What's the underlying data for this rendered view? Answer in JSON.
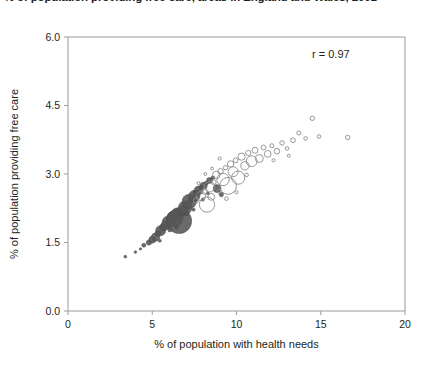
{
  "title": "% of population providing free care, areas in England and Wales, 2001",
  "annotation": "r = 0.97",
  "axis": {
    "x_title": "% of population with health needs",
    "y_title": "% of population providing free care",
    "x_ticks": [
      "0",
      "5",
      "10",
      "15",
      "20"
    ],
    "y_ticks": [
      "0.0",
      "1.5",
      "3.0",
      "4.5",
      "6.0"
    ]
  },
  "colors": {
    "filled": "#575757",
    "open_stroke": "#8c8c8c",
    "frame": "#9a9a9a",
    "text": "#231f20"
  },
  "chart_data": {
    "type": "scatter",
    "title": "% of population providing free care, areas in England and Wales, 2001",
    "xlabel": "% of population with health needs",
    "ylabel": "% of population providing free care",
    "xlim": [
      0,
      20
    ],
    "ylim": [
      0.0,
      6.0
    ],
    "xticks": [
      0,
      5,
      10,
      15,
      20
    ],
    "yticks": [
      0.0,
      1.5,
      3.0,
      4.5,
      6.0
    ],
    "grid": false,
    "legend": "none",
    "annotations": [
      {
        "text": "r = 0.97",
        "x": 15.6,
        "y": 5.55
      }
    ],
    "note": "Bubble scatter; marker size encodes area population. Dark filled markers at low x, open markers at high x.",
    "series": [
      {
        "name": "filled",
        "style": "filled",
        "points": [
          {
            "x": 3.4,
            "y": 1.19,
            "r": 1.4
          },
          {
            "x": 4.0,
            "y": 1.29,
            "r": 1.3
          },
          {
            "x": 4.5,
            "y": 1.44,
            "r": 2.0
          },
          {
            "x": 4.8,
            "y": 1.5,
            "r": 2.6
          },
          {
            "x": 5.0,
            "y": 1.56,
            "r": 3.4
          },
          {
            "x": 5.2,
            "y": 1.62,
            "r": 4.2
          },
          {
            "x": 5.35,
            "y": 1.7,
            "r": 3.0
          },
          {
            "x": 5.5,
            "y": 1.76,
            "r": 5.0
          },
          {
            "x": 5.65,
            "y": 1.83,
            "r": 3.6
          },
          {
            "x": 5.8,
            "y": 1.88,
            "r": 4.6
          },
          {
            "x": 5.95,
            "y": 1.95,
            "r": 6.0
          },
          {
            "x": 6.1,
            "y": 2.0,
            "r": 4.0
          },
          {
            "x": 6.2,
            "y": 2.06,
            "r": 5.4
          },
          {
            "x": 6.35,
            "y": 2.02,
            "r": 8.0
          },
          {
            "x": 6.5,
            "y": 2.12,
            "r": 6.4
          },
          {
            "x": 6.6,
            "y": 1.97,
            "r": 12.5
          },
          {
            "x": 6.8,
            "y": 2.2,
            "r": 5.0
          },
          {
            "x": 6.95,
            "y": 2.26,
            "r": 6.8
          },
          {
            "x": 7.1,
            "y": 2.33,
            "r": 4.2
          },
          {
            "x": 7.2,
            "y": 2.4,
            "r": 7.2
          },
          {
            "x": 7.35,
            "y": 2.46,
            "r": 3.4
          },
          {
            "x": 7.5,
            "y": 2.52,
            "r": 5.6
          },
          {
            "x": 7.6,
            "y": 2.59,
            "r": 3.0
          },
          {
            "x": 7.75,
            "y": 2.64,
            "r": 4.4
          },
          {
            "x": 7.9,
            "y": 2.7,
            "r": 2.4
          },
          {
            "x": 8.05,
            "y": 2.74,
            "r": 3.6
          },
          {
            "x": 8.2,
            "y": 2.8,
            "r": 2.0
          },
          {
            "x": 8.4,
            "y": 2.86,
            "r": 3.0
          },
          {
            "x": 8.6,
            "y": 2.92,
            "r": 1.8
          },
          {
            "x": 8.85,
            "y": 2.68,
            "r": 4.0
          },
          {
            "x": 9.1,
            "y": 2.55,
            "r": 2.2
          },
          {
            "x": 6.05,
            "y": 1.78,
            "r": 2.2
          },
          {
            "x": 6.45,
            "y": 1.83,
            "r": 1.8
          },
          {
            "x": 7.05,
            "y": 2.13,
            "r": 2.0
          },
          {
            "x": 7.45,
            "y": 2.22,
            "r": 1.6
          },
          {
            "x": 8.0,
            "y": 2.44,
            "r": 1.6
          },
          {
            "x": 8.3,
            "y": 2.58,
            "r": 1.5
          },
          {
            "x": 5.45,
            "y": 1.54,
            "r": 1.5
          },
          {
            "x": 4.3,
            "y": 1.36,
            "r": 1.2
          }
        ]
      },
      {
        "name": "open",
        "style": "open",
        "points": [
          {
            "x": 7.6,
            "y": 2.42,
            "r": 2.6
          },
          {
            "x": 7.9,
            "y": 2.52,
            "r": 4.6
          },
          {
            "x": 8.1,
            "y": 2.62,
            "r": 3.0
          },
          {
            "x": 8.25,
            "y": 2.33,
            "r": 7.6
          },
          {
            "x": 8.4,
            "y": 2.72,
            "r": 5.2
          },
          {
            "x": 8.5,
            "y": 2.5,
            "r": 3.4
          },
          {
            "x": 8.65,
            "y": 2.82,
            "r": 2.4
          },
          {
            "x": 8.8,
            "y": 2.98,
            "r": 3.8
          },
          {
            "x": 8.95,
            "y": 2.62,
            "r": 2.0
          },
          {
            "x": 9.05,
            "y": 3.06,
            "r": 2.8
          },
          {
            "x": 9.2,
            "y": 2.88,
            "r": 6.2
          },
          {
            "x": 9.35,
            "y": 3.14,
            "r": 2.2
          },
          {
            "x": 9.5,
            "y": 2.74,
            "r": 8.4
          },
          {
            "x": 9.65,
            "y": 3.22,
            "r": 3.2
          },
          {
            "x": 9.8,
            "y": 3.05,
            "r": 5.0
          },
          {
            "x": 9.95,
            "y": 3.3,
            "r": 2.4
          },
          {
            "x": 10.1,
            "y": 2.92,
            "r": 6.6
          },
          {
            "x": 10.3,
            "y": 3.38,
            "r": 3.6
          },
          {
            "x": 10.5,
            "y": 3.18,
            "r": 4.2
          },
          {
            "x": 10.7,
            "y": 3.46,
            "r": 2.6
          },
          {
            "x": 10.9,
            "y": 3.28,
            "r": 5.4
          },
          {
            "x": 11.1,
            "y": 3.52,
            "r": 3.0
          },
          {
            "x": 11.35,
            "y": 3.34,
            "r": 4.0
          },
          {
            "x": 11.6,
            "y": 3.58,
            "r": 2.4
          },
          {
            "x": 11.85,
            "y": 3.44,
            "r": 3.4
          },
          {
            "x": 12.1,
            "y": 3.62,
            "r": 2.0
          },
          {
            "x": 12.4,
            "y": 3.5,
            "r": 2.8
          },
          {
            "x": 12.7,
            "y": 3.68,
            "r": 2.2
          },
          {
            "x": 13.0,
            "y": 3.56,
            "r": 1.8
          },
          {
            "x": 13.35,
            "y": 3.74,
            "r": 2.4
          },
          {
            "x": 13.7,
            "y": 3.9,
            "r": 2.0
          },
          {
            "x": 14.1,
            "y": 3.78,
            "r": 1.8
          },
          {
            "x": 14.5,
            "y": 4.22,
            "r": 2.2
          },
          {
            "x": 14.9,
            "y": 3.82,
            "r": 1.8
          },
          {
            "x": 16.6,
            "y": 3.8,
            "r": 2.2
          },
          {
            "x": 9.0,
            "y": 3.34,
            "r": 1.6
          },
          {
            "x": 9.4,
            "y": 2.46,
            "r": 1.8
          },
          {
            "x": 10.0,
            "y": 2.6,
            "r": 1.6
          },
          {
            "x": 10.6,
            "y": 2.98,
            "r": 1.8
          },
          {
            "x": 12.2,
            "y": 3.3,
            "r": 1.6
          },
          {
            "x": 13.1,
            "y": 3.4,
            "r": 1.5
          },
          {
            "x": 8.15,
            "y": 3.0,
            "r": 1.5
          },
          {
            "x": 8.55,
            "y": 3.12,
            "r": 1.4
          },
          {
            "x": 7.75,
            "y": 2.8,
            "r": 1.5
          }
        ]
      }
    ]
  }
}
